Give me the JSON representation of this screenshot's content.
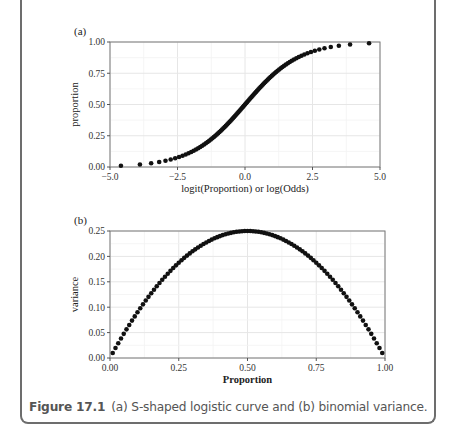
{
  "figure": {
    "label": "Figure 17.1",
    "caption": "(a) S-shaped logistic curve and (b) binomial variance."
  },
  "chart_data": [
    {
      "panel": "(a)",
      "type": "scatter",
      "title": "",
      "xlabel": "logit(Proportion) or log(Odds)",
      "ylabel": "proportion",
      "xlim": [
        -5.0,
        5.0
      ],
      "ylim": [
        0.0,
        1.0
      ],
      "xticks": [
        "-5.0",
        "-2.5",
        "0.0",
        "2.5",
        "5.0"
      ],
      "yticks": [
        "0.00",
        "0.25",
        "0.50",
        "0.75",
        "1.00"
      ],
      "grid": true,
      "description": "proportion p from 0.01 to 0.99 in steps of 0.01 plotted against logit(p)",
      "p_range": [
        0.01,
        0.99
      ],
      "p_step": 0.01
    },
    {
      "panel": "(b)",
      "type": "scatter",
      "title": "",
      "xlabel": "Proportion",
      "ylabel": "variance",
      "xlim": [
        0.0,
        1.0
      ],
      "ylim": [
        0.0,
        0.25
      ],
      "xticks": [
        "0.00",
        "0.25",
        "0.50",
        "0.75",
        "1.00"
      ],
      "yticks": [
        "0.00",
        "0.05",
        "0.10",
        "0.15",
        "0.20",
        "0.25"
      ],
      "grid": true,
      "description": "variance p(1-p) for p from 0.01 to 0.99 in steps of 0.01",
      "p_range": [
        0.01,
        0.99
      ],
      "p_step": 0.01
    }
  ]
}
